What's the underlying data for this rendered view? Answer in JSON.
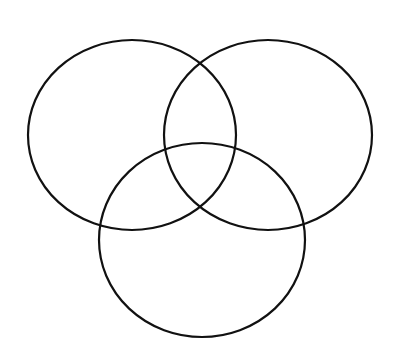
{
  "diagram": {
    "type": "venn",
    "sets": 3,
    "stroke_color": "#111111",
    "background": "#ffffff",
    "circles": [
      {
        "name": "top-left",
        "cx": 132,
        "cy": 135,
        "rx": 104,
        "ry": 95
      },
      {
        "name": "top-right",
        "cx": 268,
        "cy": 135,
        "rx": 104,
        "ry": 95
      },
      {
        "name": "bottom",
        "cx": 202,
        "cy": 240,
        "rx": 103,
        "ry": 97
      }
    ]
  }
}
